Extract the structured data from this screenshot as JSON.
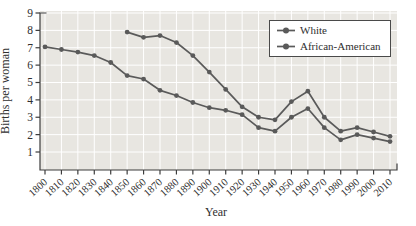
{
  "chart_data": {
    "type": "line",
    "title": "",
    "xlabel": "Year",
    "ylabel": "Births per woman",
    "categories": [
      "1800",
      "1810",
      "1820",
      "1830",
      "1840",
      "1850",
      "1860",
      "1870",
      "1880",
      "1890",
      "1900",
      "1910",
      "1920",
      "1930",
      "1940",
      "1950",
      "1960",
      "1970",
      "1980",
      "1990",
      "2000",
      "2010"
    ],
    "yticks": [
      1,
      2,
      3,
      4,
      5,
      6,
      7,
      8,
      9
    ],
    "ylim": [
      1,
      9
    ],
    "grid": true,
    "marker": "circle",
    "legend_position": "top-right",
    "series": [
      {
        "name": "White",
        "color": "#5a5a5a",
        "values": [
          7.05,
          6.9,
          6.75,
          6.55,
          6.15,
          5.4,
          5.2,
          4.55,
          4.25,
          3.85,
          3.55,
          3.4,
          3.15,
          2.4,
          2.2,
          3.0,
          3.5,
          2.4,
          1.7,
          2.0,
          1.8,
          1.6
        ]
      },
      {
        "name": "African-American",
        "color": "#5a5a5a",
        "values": [
          null,
          null,
          null,
          null,
          null,
          7.9,
          7.6,
          7.7,
          7.3,
          6.55,
          5.6,
          4.6,
          3.6,
          3.0,
          2.85,
          3.9,
          4.5,
          3.0,
          2.2,
          2.4,
          2.15,
          1.9
        ]
      }
    ],
    "colors": {
      "plot_background": "#e8e6e1",
      "gridline": "#ffffff",
      "axis": "#3d3d3d",
      "text": "#2f2f2f",
      "legend_background": "#ffffff",
      "legend_border": "#4a4a4a"
    }
  }
}
